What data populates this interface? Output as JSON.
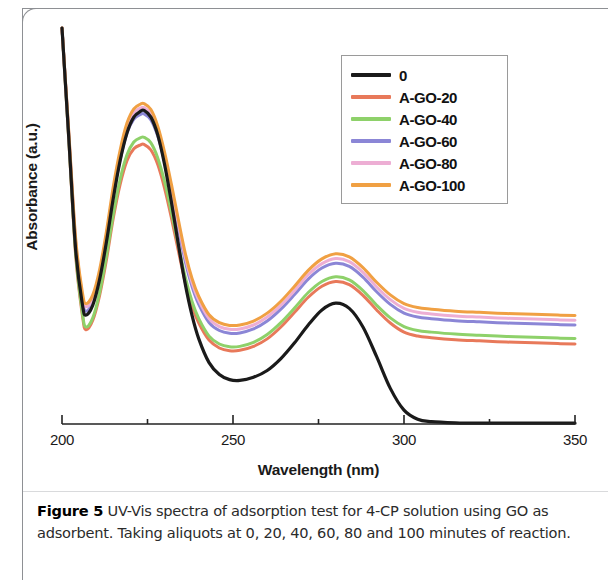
{
  "figure": {
    "caption_label": "Figure 5",
    "caption_text": " UV-Vis spectra of adsorption test for 4-CP solution using GO as adsorbent. Taking aliquots at 0, 20, 40, 60, 80 and 100 minutes of reaction."
  },
  "chart_data": {
    "type": "line",
    "title": "",
    "xlabel": "Wavelength (nm)",
    "ylabel": "Absorbance (a.u.)",
    "xlim": [
      200,
      350
    ],
    "ylim": [
      0,
      1.0
    ],
    "xticks": [
      200,
      250,
      300,
      350
    ],
    "xtick_labels": [
      "200",
      "250",
      "300",
      "350"
    ],
    "xticks_minor": [
      225,
      275,
      325
    ],
    "yticks": [],
    "ytick_labels": [],
    "grid": false,
    "legend_position": "upper right",
    "axis_style": "x-axis only, no y-axis ticks",
    "peaks_nm": [
      224,
      280
    ],
    "x": [
      200,
      202,
      204,
      206,
      207,
      209,
      211,
      213,
      215,
      217,
      219,
      221,
      223,
      224,
      226,
      228,
      230,
      232,
      234,
      236,
      238,
      240,
      243,
      246,
      249,
      252,
      256,
      260,
      264,
      268,
      272,
      276,
      280,
      284,
      288,
      292,
      296,
      300,
      304,
      308,
      315,
      322,
      330,
      338,
      345,
      350
    ],
    "series": [
      {
        "name": "0",
        "label": "0",
        "color": "#1a1a1a",
        "values": [
          1.0,
          0.72,
          0.44,
          0.3,
          0.275,
          0.3,
          0.365,
          0.46,
          0.57,
          0.665,
          0.735,
          0.775,
          0.79,
          0.792,
          0.775,
          0.73,
          0.655,
          0.56,
          0.455,
          0.355,
          0.275,
          0.215,
          0.155,
          0.125,
          0.112,
          0.11,
          0.118,
          0.135,
          0.165,
          0.205,
          0.25,
          0.288,
          0.305,
          0.292,
          0.245,
          0.17,
          0.09,
          0.035,
          0.012,
          0.006,
          0.003,
          0.002,
          0.002,
          0.002,
          0.002,
          0.002
        ]
      },
      {
        "name": "A-GO-20",
        "label": "A-GO-20",
        "color": "#e8795a",
        "values": [
          1.0,
          0.715,
          0.425,
          0.272,
          0.238,
          0.262,
          0.325,
          0.415,
          0.52,
          0.605,
          0.665,
          0.695,
          0.705,
          0.706,
          0.692,
          0.655,
          0.595,
          0.52,
          0.438,
          0.36,
          0.298,
          0.255,
          0.212,
          0.192,
          0.185,
          0.186,
          0.196,
          0.215,
          0.245,
          0.282,
          0.32,
          0.348,
          0.36,
          0.352,
          0.325,
          0.288,
          0.255,
          0.232,
          0.222,
          0.218,
          0.213,
          0.21,
          0.207,
          0.205,
          0.203,
          0.202
        ]
      },
      {
        "name": "A-GO-40",
        "label": "A-GO-40",
        "color": "#8ed16a",
        "values": [
          1.0,
          0.718,
          0.432,
          0.278,
          0.245,
          0.268,
          0.332,
          0.425,
          0.53,
          0.618,
          0.68,
          0.712,
          0.723,
          0.724,
          0.71,
          0.672,
          0.612,
          0.535,
          0.452,
          0.372,
          0.31,
          0.266,
          0.222,
          0.202,
          0.195,
          0.196,
          0.206,
          0.226,
          0.256,
          0.293,
          0.332,
          0.36,
          0.372,
          0.364,
          0.337,
          0.3,
          0.268,
          0.246,
          0.236,
          0.232,
          0.227,
          0.224,
          0.221,
          0.219,
          0.217,
          0.216
        ]
      },
      {
        "name": "A-GO-60",
        "label": "A-GO-60",
        "color": "#8b86d6",
        "values": [
          1.0,
          0.728,
          0.455,
          0.312,
          0.285,
          0.308,
          0.372,
          0.468,
          0.578,
          0.668,
          0.735,
          0.77,
          0.782,
          0.783,
          0.768,
          0.727,
          0.662,
          0.582,
          0.495,
          0.412,
          0.348,
          0.302,
          0.256,
          0.236,
          0.229,
          0.23,
          0.24,
          0.26,
          0.29,
          0.327,
          0.366,
          0.394,
          0.406,
          0.398,
          0.371,
          0.334,
          0.302,
          0.28,
          0.27,
          0.266,
          0.261,
          0.258,
          0.255,
          0.253,
          0.251,
          0.25
        ]
      },
      {
        "name": "A-GO-80",
        "label": "A-GO-80",
        "color": "#edaed4",
        "values": [
          1.0,
          0.732,
          0.462,
          0.322,
          0.296,
          0.318,
          0.382,
          0.478,
          0.59,
          0.682,
          0.75,
          0.786,
          0.798,
          0.799,
          0.784,
          0.742,
          0.676,
          0.595,
          0.507,
          0.423,
          0.358,
          0.312,
          0.266,
          0.246,
          0.239,
          0.24,
          0.25,
          0.27,
          0.3,
          0.337,
          0.377,
          0.405,
          0.418,
          0.41,
          0.383,
          0.346,
          0.314,
          0.292,
          0.282,
          0.278,
          0.273,
          0.27,
          0.267,
          0.265,
          0.263,
          0.262
        ]
      },
      {
        "name": "A-GO-100",
        "label": "A-GO-100",
        "color": "#f0a043",
        "values": [
          1.0,
          0.735,
          0.468,
          0.33,
          0.304,
          0.326,
          0.39,
          0.487,
          0.6,
          0.692,
          0.76,
          0.796,
          0.808,
          0.809,
          0.794,
          0.752,
          0.686,
          0.605,
          0.517,
          0.433,
          0.368,
          0.322,
          0.276,
          0.256,
          0.249,
          0.25,
          0.26,
          0.28,
          0.31,
          0.348,
          0.388,
          0.417,
          0.43,
          0.422,
          0.395,
          0.358,
          0.326,
          0.304,
          0.294,
          0.29,
          0.285,
          0.282,
          0.279,
          0.277,
          0.275,
          0.274
        ]
      }
    ]
  }
}
